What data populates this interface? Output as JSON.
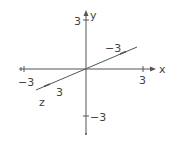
{
  "diagram": {
    "type": "3d-coordinate-axes",
    "line_color": "#555555",
    "text_color": "#444444",
    "axes": {
      "x": {
        "label": "x",
        "range": [
          -3,
          3
        ],
        "tick_labels": {
          "min": "-3",
          "max": "3"
        }
      },
      "y": {
        "label": "y",
        "range": [
          -3,
          3
        ],
        "tick_labels": {
          "min": "-3",
          "max": "3"
        }
      },
      "z": {
        "label": "z",
        "range": [
          -3,
          3
        ],
        "tick_labels": {
          "min": "-3",
          "max": "3"
        }
      }
    }
  }
}
